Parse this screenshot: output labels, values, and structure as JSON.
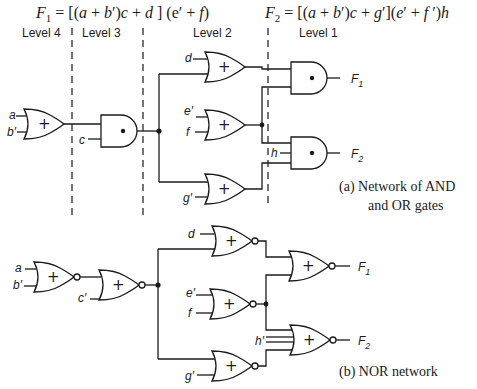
{
  "equations": {
    "f1": "F₁ = [(a + b′)c + d] (e′ + f)",
    "f2": "F₂ = [(a + b′)c + g′](e′ + f′)h"
  },
  "levels": [
    "Level 4",
    "Level 3",
    "Level 2",
    "Level 1"
  ],
  "network_a": {
    "caption_line1": "(a)   Network of AND",
    "caption_line2": "and OR gates",
    "inputs": {
      "a": "a",
      "b": "b′",
      "c": "c",
      "d": "d",
      "e": "e′",
      "f": "f",
      "g": "g′",
      "h": "h"
    },
    "outputs": {
      "f1": "F",
      "f1_sub": "1",
      "f2": "F",
      "f2_sub": "2"
    },
    "gate_symbols": {
      "or": "+",
      "and": "•"
    }
  },
  "network_b": {
    "caption": "(b)   NOR network",
    "inputs": {
      "a": "a",
      "b": "b′",
      "c": "c′",
      "d": "d",
      "e": "e′",
      "f": "f",
      "g": "g′",
      "h": "h′"
    },
    "outputs": {
      "f1": "F",
      "f1_sub": "1",
      "f2": "F",
      "f2_sub": "2"
    },
    "gate_symbols": {
      "nor": "+"
    }
  }
}
